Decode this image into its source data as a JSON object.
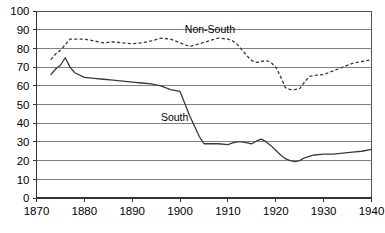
{
  "chart_data": {
    "type": "line",
    "title": "",
    "subtitle": "",
    "xlabel": "",
    "ylabel": "",
    "xlim": [
      1870,
      1940
    ],
    "ylim": [
      0,
      100
    ],
    "grid": true,
    "legend_position": "inline-annotations",
    "x_ticks": [
      "1870",
      "1880",
      "1890",
      "1900",
      "1910",
      "1920",
      "1930",
      "1940"
    ],
    "x_tick_values": [
      1870,
      1880,
      1890,
      1900,
      1910,
      1920,
      1930,
      1940
    ],
    "y_ticks": [
      "0",
      "10",
      "20",
      "30",
      "40",
      "50",
      "60",
      "70",
      "80",
      "90",
      "100"
    ],
    "y_tick_values": [
      0,
      10,
      20,
      30,
      40,
      50,
      60,
      70,
      80,
      90,
      100
    ],
    "annotations": [
      {
        "text": "Non-South",
        "x": 1901,
        "y": 88
      },
      {
        "text": "South",
        "x": 1896,
        "y": 41
      }
    ],
    "series": [
      {
        "name": "South",
        "style": "solid",
        "color": "#3a3a3a",
        "x": [
          1873,
          1874,
          1875,
          1876,
          1877,
          1878,
          1880,
          1882,
          1884,
          1886,
          1888,
          1890,
          1892,
          1894,
          1896,
          1898,
          1900,
          1902,
          1904,
          1905,
          1906,
          1908,
          1910,
          1911,
          1912,
          1913,
          1914,
          1915,
          1916,
          1917,
          1918,
          1919,
          1920,
          1921,
          1922,
          1923,
          1924,
          1925,
          1926,
          1928,
          1930,
          1932,
          1934,
          1936,
          1938,
          1940
        ],
        "y": [
          66,
          69,
          71,
          75,
          70,
          67,
          64.5,
          64,
          63.5,
          63,
          62.5,
          62,
          61.5,
          61,
          60,
          58,
          57,
          44,
          33,
          29,
          29,
          29,
          28.5,
          29.5,
          30,
          30,
          29.5,
          29,
          30.5,
          31.5,
          30,
          28,
          25.5,
          23,
          21,
          20,
          19.5,
          20,
          21.5,
          23,
          23.5,
          23.5,
          24,
          24.5,
          25,
          26
        ]
      },
      {
        "name": "Non-South",
        "style": "dashed",
        "color": "#3a3a3a",
        "x": [
          1873,
          1874,
          1875,
          1876,
          1877,
          1878,
          1880,
          1882,
          1884,
          1886,
          1888,
          1890,
          1892,
          1894,
          1896,
          1898,
          1900,
          1902,
          1904,
          1906,
          1908,
          1910,
          1911,
          1912,
          1913,
          1914,
          1915,
          1916,
          1917,
          1918,
          1919,
          1920,
          1921,
          1922,
          1923,
          1924,
          1925,
          1926,
          1927,
          1928,
          1930,
          1932,
          1934,
          1936,
          1938,
          1940
        ],
        "y": [
          74,
          77,
          79,
          82,
          85,
          85,
          85,
          84,
          83,
          83.5,
          83,
          82.5,
          83,
          84,
          85.5,
          85,
          83,
          81,
          82.5,
          84,
          85.5,
          85,
          84,
          82,
          79,
          76,
          73.5,
          72.5,
          73,
          73.5,
          72.5,
          70,
          65,
          59,
          58,
          58,
          58.5,
          62,
          65,
          65.5,
          66,
          68,
          70,
          72,
          73,
          74
        ]
      }
    ]
  }
}
